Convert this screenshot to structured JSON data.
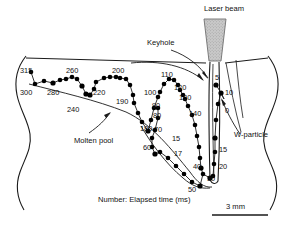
{
  "figure": {
    "caption": "Number: Elapsed time (ms)",
    "scale_label": "3 mm"
  },
  "annotations": {
    "laser_beam": "Laser beam",
    "keyhole": "Keyhole",
    "molten_pool": "Molten pool",
    "w_particle": "W-particle"
  },
  "colors": {
    "line": "#1a1a1a",
    "marker": "#000000",
    "beam_fill": "#bdbdbd",
    "background": "#ffffff"
  },
  "chart_data": {
    "type": "scatter",
    "xlabel": "",
    "ylabel": "",
    "legend": "none",
    "grid": false,
    "units": "ms",
    "label_meaning": "Number: Elapsed time (ms)",
    "time_labels": [
      "0",
      "5",
      "10",
      "15",
      "17",
      "20",
      "30",
      "40",
      "50",
      "60",
      "70",
      "80",
      "90",
      "100",
      "110",
      "120",
      "130",
      "140",
      "180",
      "190",
      "200",
      "220",
      "240",
      "260",
      "280",
      "300",
      "315"
    ],
    "points": [
      {
        "t": "0",
        "x": 224,
        "y": 99
      },
      {
        "t": "5",
        "x": 216,
        "y": 85
      },
      {
        "t": "10",
        "x": 221,
        "y": 93
      },
      {
        "t": "15",
        "x": 215,
        "y": 138
      },
      {
        "t": "20",
        "x": 216,
        "y": 152
      },
      {
        "t": "30",
        "x": 213,
        "y": 176
      },
      {
        "t": "40",
        "x": 201,
        "y": 168
      },
      {
        "t": "50",
        "x": 200,
        "y": 186
      },
      {
        "t": "60",
        "x": 155,
        "y": 154
      },
      {
        "t": "70",
        "x": 161,
        "y": 133
      },
      {
        "t": "80",
        "x": 158,
        "y": 118
      },
      {
        "t": "90",
        "x": 158,
        "y": 108
      },
      {
        "t": "100",
        "x": 160,
        "y": 92
      },
      {
        "t": "110",
        "x": 172,
        "y": 79
      },
      {
        "t": "120",
        "x": 180,
        "y": 90
      },
      {
        "t": "130",
        "x": 185,
        "y": 99
      },
      {
        "t": "140",
        "x": 192,
        "y": 115
      },
      {
        "t": "180",
        "x": 148,
        "y": 131
      },
      {
        "t": "190",
        "x": 134,
        "y": 103
      },
      {
        "t": "200",
        "x": 120,
        "y": 78
      },
      {
        "t": "220",
        "x": 96,
        "y": 82
      },
      {
        "t": "240",
        "x": 76,
        "y": 96
      },
      {
        "t": "260",
        "x": 72,
        "y": 77
      },
      {
        "t": "280",
        "x": 53,
        "y": 83
      },
      {
        "t": "300",
        "x": 35,
        "y": 84
      },
      {
        "t": "315",
        "x": 31,
        "y": 72
      }
    ],
    "label_positions": [
      {
        "text": "315",
        "x": 20,
        "y": 67
      },
      {
        "text": "300",
        "x": 20,
        "y": 89
      },
      {
        "text": "280",
        "x": 47,
        "y": 89
      },
      {
        "text": "260",
        "x": 66,
        "y": 67
      },
      {
        "text": "240",
        "x": 67,
        "y": 106
      },
      {
        "text": "220",
        "x": 93,
        "y": 89
      },
      {
        "text": "200",
        "x": 112,
        "y": 67
      },
      {
        "text": "190",
        "x": 116,
        "y": 98
      },
      {
        "text": "180",
        "x": 140,
        "y": 125
      },
      {
        "text": "100",
        "x": 144,
        "y": 89
      },
      {
        "text": "110",
        "x": 161,
        "y": 71
      },
      {
        "text": "120",
        "x": 174,
        "y": 84
      },
      {
        "text": "130",
        "x": 179,
        "y": 94
      },
      {
        "text": "140",
        "x": 189,
        "y": 110
      },
      {
        "text": "90",
        "x": 152,
        "y": 102
      },
      {
        "text": "80",
        "x": 153,
        "y": 112
      },
      {
        "text": "70",
        "x": 154,
        "y": 126
      },
      {
        "text": "60",
        "x": 143,
        "y": 144
      },
      {
        "text": "15",
        "x": 172,
        "y": 135
      },
      {
        "text": "17",
        "x": 174,
        "y": 150
      },
      {
        "text": "40",
        "x": 193,
        "y": 163
      },
      {
        "text": "50",
        "x": 188,
        "y": 186
      },
      {
        "text": "30",
        "x": 207,
        "y": 175
      },
      {
        "text": "20",
        "x": 219,
        "y": 163
      },
      {
        "text": "15",
        "x": 219,
        "y": 146
      },
      {
        "text": "5",
        "x": 215,
        "y": 74
      },
      {
        "text": "10",
        "x": 225,
        "y": 89
      },
      {
        "text": "0",
        "x": 225,
        "y": 107
      }
    ]
  }
}
